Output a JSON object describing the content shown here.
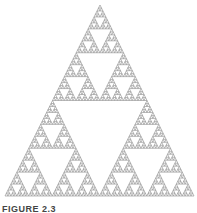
{
  "figure": {
    "type": "sierpinski-triangle",
    "depth": 6,
    "apex": [
      100,
      5
    ],
    "base_left": [
      5,
      196
    ],
    "base_right": [
      194,
      196
    ],
    "stroke_color": "#8a8a8a",
    "fill_color": "#ffffff",
    "caption": "FIGURE 2.3"
  }
}
